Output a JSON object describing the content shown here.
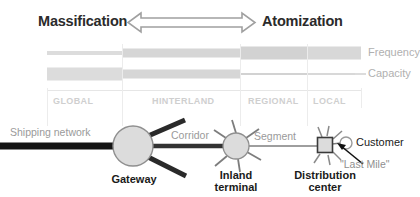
{
  "header": {
    "left_label": "Massification",
    "right_label": "Atomization",
    "arrow_icon": "double-headed-horizontal-arrow"
  },
  "legend": {
    "frequency_label": "Frequency",
    "capacity_label": "Capacity",
    "bar_color": "#d8d8d8",
    "text_color": "#b0b0b0"
  },
  "zones": [
    {
      "label": "GLOBAL",
      "x": 47,
      "width": 75
    },
    {
      "label": "HINTERLAND",
      "x": 122,
      "width": 118
    },
    {
      "label": "REGIONAL",
      "x": 240,
      "width": 67
    },
    {
      "label": "LOCAL",
      "x": 307,
      "width": 54
    }
  ],
  "bars": {
    "frequency": {
      "name": "Frequency",
      "description": "Thickness increases from global to local",
      "segments": [
        {
          "zone": "GLOBAL",
          "x": 47,
          "width": 75,
          "thickness": 4
        },
        {
          "zone": "HINTERLAND",
          "x": 122,
          "width": 118,
          "thickness": 9
        },
        {
          "zone": "REGIONAL",
          "x": 240,
          "width": 67,
          "thickness": 13
        },
        {
          "zone": "LOCAL",
          "x": 307,
          "width": 54,
          "thickness": 13
        }
      ]
    },
    "capacity": {
      "name": "Capacity",
      "description": "Thickness decreases from global to local",
      "segments": [
        {
          "zone": "GLOBAL",
          "x": 47,
          "width": 75,
          "thickness": 13
        },
        {
          "zone": "HINTERLAND",
          "x": 122,
          "width": 118,
          "thickness": 9
        },
        {
          "zone": "REGIONAL",
          "x": 240,
          "width": 67,
          "thickness": 2
        },
        {
          "zone": "LOCAL",
          "x": 307,
          "width": 54,
          "thickness": 2
        }
      ]
    }
  },
  "network": {
    "links": [
      {
        "name": "shipping-network",
        "label": "Shipping network"
      },
      {
        "name": "corridor",
        "label": "Corridor"
      },
      {
        "name": "segment",
        "label": "Segment"
      },
      {
        "name": "last-mile",
        "label": "\"Last Mile\""
      }
    ],
    "nodes": [
      {
        "name": "gateway",
        "label": "Gateway",
        "shape": "large-circle",
        "cx": 133,
        "cy": 146,
        "r": 20
      },
      {
        "name": "inland-terminal",
        "label": "Inland\nterminal",
        "shape": "medium-circle",
        "cx": 236,
        "cy": 146,
        "r": 13
      },
      {
        "name": "distribution-center",
        "label": "Distribution\ncenter",
        "shape": "square",
        "cx": 325,
        "cy": 145,
        "r": 8
      },
      {
        "name": "customer",
        "label": "Customer",
        "shape": "small-circle",
        "cx": 346,
        "cy": 143,
        "r": 6
      }
    ],
    "node_labels": {
      "gateway": "Gateway",
      "inland_terminal_line1": "Inland",
      "inland_terminal_line2": "terminal",
      "distribution_center_line1": "Distribution",
      "distribution_center_line2": "center",
      "customer": "Customer"
    }
  },
  "colors": {
    "background": "#ffffff",
    "dark_line": "#1a1a1a",
    "node_fill": "#dcdcdc",
    "node_stroke": "#8c8c8c",
    "divider": "#e4e4e4",
    "arrow_stroke": "#9e9e9e"
  }
}
